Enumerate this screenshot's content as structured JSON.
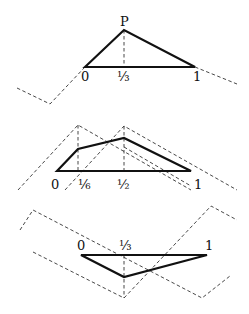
{
  "diagrams": [
    {
      "id": "top",
      "labels": {
        "p": "P",
        "zero": "0",
        "third": "⅓",
        "one": "1"
      },
      "description": "Triangle with apex P above x=1/3 on segment [0,1]"
    },
    {
      "id": "middle",
      "labels": {
        "zero": "0",
        "sixth": "⅙",
        "half": "½",
        "one": "1"
      },
      "description": "Polygon over [0,1] with vertices above 1/6 and 1/2 and two dashed tent functions"
    },
    {
      "id": "bottom",
      "labels": {
        "zero": "0",
        "third": "⅓",
        "one": "1"
      },
      "description": "Inverted triangle with vertex below x=1/3 on segment [0,1]"
    }
  ],
  "colors": {
    "line": "#111111",
    "dashed": "#333333",
    "background": "#ffffff"
  }
}
